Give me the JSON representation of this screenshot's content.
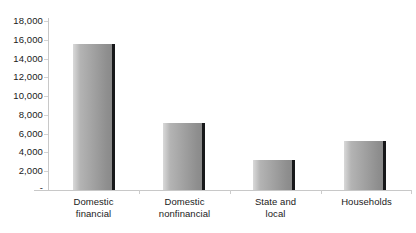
{
  "chart_data": {
    "type": "bar",
    "title": "",
    "subtitle": "",
    "xlabel": "",
    "ylabel": "",
    "categories": [
      "Domestic financial",
      "Domestic nonfinancial",
      "State and local",
      "Households"
    ],
    "category_lines": [
      [
        "Domestic",
        "financial"
      ],
      [
        "Domestic",
        "nonfinancial"
      ],
      [
        "State and",
        "local"
      ],
      [
        "Households"
      ]
    ],
    "values": [
      15600,
      7150,
      3200,
      5250
    ],
    "ylim": [
      0,
      18000
    ],
    "ytick_values": [
      0,
      2000,
      4000,
      6000,
      8000,
      10000,
      12000,
      14000,
      16000,
      18000
    ],
    "ytick_labels": [
      "-",
      "2,000",
      "4,000",
      "6,000",
      "8,000",
      "10,000",
      "12,000",
      "14,000",
      "16,000",
      "18,000"
    ],
    "grid": false,
    "legend": null,
    "legend_position": "none",
    "series": [
      {
        "name": "",
        "values": [
          15600,
          7150,
          3200,
          5250
        ]
      }
    ],
    "colors": {
      "bar_fill_light": "#d9d9d9",
      "bar_fill_dark": "#8a8a8a",
      "bar_edge": "#17181a",
      "axis_line": "#c8c8c8",
      "text": "#1a1a1a",
      "background": "#ffffff"
    }
  }
}
